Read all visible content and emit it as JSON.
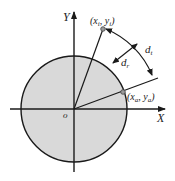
{
  "diagram": {
    "axes": {
      "x_label": "X",
      "y_label": "Y",
      "origin_label": "o"
    },
    "points": {
      "inner": {
        "label": "(x",
        "sub1": "i",
        "mid": ", y",
        "sub2": "i",
        "end": ")"
      },
      "outer": {
        "label": "(x",
        "sub1": "a",
        "mid": ", y",
        "sub2": "a",
        "end": ")"
      }
    },
    "distances": {
      "radial": {
        "label": "d",
        "sub": "r"
      },
      "tangential": {
        "label": "d",
        "sub": "t"
      }
    },
    "colors": {
      "circle_fill": "#d9d9d9",
      "stroke": "#1a1a1a",
      "point": "#9a9a9a"
    }
  }
}
